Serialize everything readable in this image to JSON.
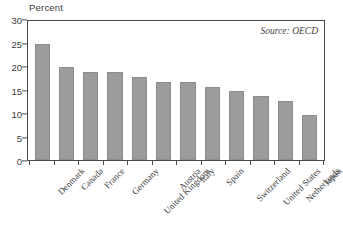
{
  "chart_data": {
    "type": "bar",
    "title": "",
    "xlabel": "",
    "ylabel": "Percent",
    "ylim": [
      0,
      30
    ],
    "yticks": [
      0,
      5,
      10,
      15,
      20,
      25,
      30
    ],
    "grid": false,
    "legend": null,
    "annotation": "Source: OECD",
    "categories": [
      "Denmark",
      "Canada",
      "France",
      "Germany",
      "United Kingdom",
      "Austria",
      "Italy",
      "Spain",
      "Switzerland",
      "United States",
      "Netherlands",
      "Japan"
    ],
    "values": [
      25.1,
      20.0,
      19.0,
      18.9,
      17.9,
      16.9,
      16.8,
      15.8,
      14.8,
      13.8,
      12.8,
      9.8
    ],
    "bar_color": "#9c9c9c",
    "axis_color": "#4a4a4a",
    "text_color": "#3b3b3b"
  }
}
